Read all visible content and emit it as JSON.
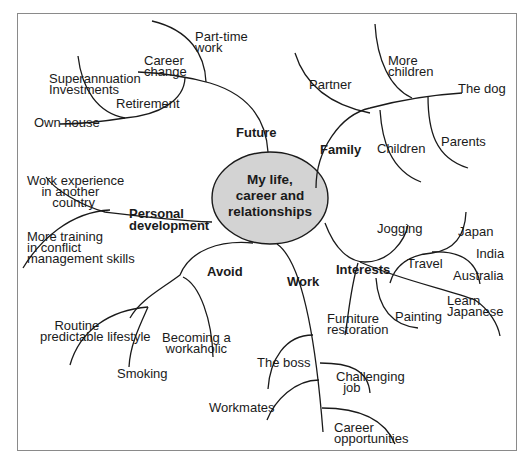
{
  "diagram": {
    "type": "mind-map",
    "center": {
      "lines": [
        "My life,",
        "career and",
        "relationships"
      ],
      "fill": "#d3d3d3"
    },
    "branches": [
      {
        "label": "Future",
        "children": [
          "Part-time work",
          "Career change",
          "Superannuation",
          "Investments",
          "Retirement",
          "Own house"
        ]
      },
      {
        "label": "Family",
        "children": [
          "Partner",
          "More children",
          "The dog",
          "Children",
          "Parents"
        ]
      },
      {
        "label": "Personal development",
        "children": [
          "Work experience in another country",
          "More training in conflict management skills"
        ]
      },
      {
        "label": "Avoid",
        "children": [
          "Routine predictable lifestyle",
          "Smoking",
          "Becoming a workaholic"
        ]
      },
      {
        "label": "Work",
        "children": [
          "The boss",
          "Workmates",
          "Challenging job",
          "Career opportunities"
        ]
      },
      {
        "label": "Interests",
        "children": [
          "Jogging",
          "Travel",
          "Japan",
          "India",
          "Australia",
          "Furniture restoration",
          "Painting",
          "Learn Japanese"
        ]
      }
    ]
  },
  "labels": {
    "future": "Future",
    "part_time": "Part-time\nwork",
    "career_change": "Career\nchange",
    "superannuation": "Superannuation\nInvestments",
    "retirement": "Retirement",
    "own_house": "Own house",
    "family": "Family",
    "partner": "Partner",
    "more_children": "More\nchildren",
    "the_dog": "The dog",
    "children": "Children",
    "parents": "Parents",
    "personal_dev": "Personal\ndevelopment",
    "work_exp": "Work experience\n    in another\n       country",
    "more_training": "More training\nin conflict\nmanagement skills",
    "avoid": "Avoid",
    "routine": "    Routine\npredictable lifestyle",
    "smoking": "Smoking",
    "workaholic": "Becoming a\n workaholic",
    "work": "Work",
    "the_boss": "The boss",
    "workmates": "Workmates",
    "challenging": "Challenging\n  job",
    "career_opp": "Career\nopportunities",
    "interests": "Interests",
    "jogging": "Jogging",
    "travel": "Travel",
    "japan": "Japan",
    "india": "India",
    "australia": "Australia",
    "furniture": "Furniture\nrestoration",
    "painting": "Painting",
    "learn_japanese": "Learn\nJapanese"
  }
}
